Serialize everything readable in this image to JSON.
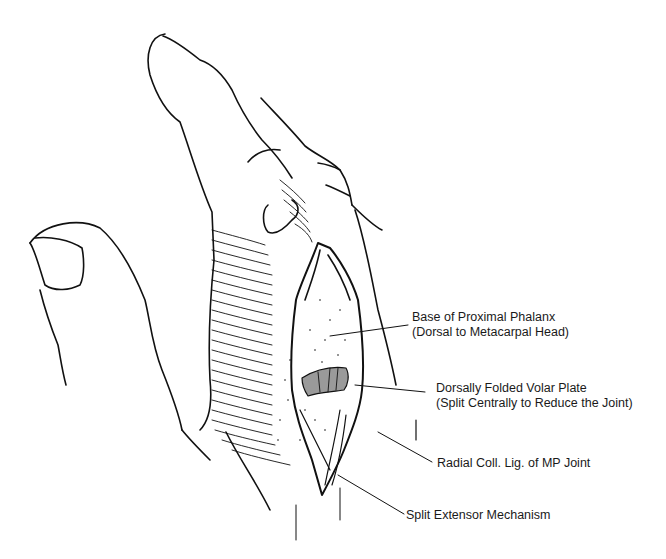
{
  "figure": {
    "colors": {
      "line": "#111111",
      "volar_plate_fill": "#9a9a9a",
      "background": "#ffffff"
    }
  },
  "labels": [
    {
      "id": "base-proximal-phalanx",
      "line1": "Base of Proximal Phalanx",
      "line2": "(Dorsal to Metacarpal Head)"
    },
    {
      "id": "volar-plate",
      "line1": "Dorsally Folded Volar Plate",
      "line2": "(Split Centrally to Reduce the Joint)"
    },
    {
      "id": "radial-coll-lig",
      "line1": "Radial Coll. Lig. of MP Joint"
    },
    {
      "id": "split-extensor",
      "line1": "Split Extensor Mechanism"
    }
  ]
}
